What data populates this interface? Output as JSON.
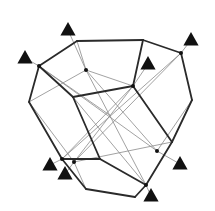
{
  "diagram": {
    "type": "polyhedron-wireframe",
    "background": "#ffffff",
    "stroke_color": "#2a2a2a",
    "thin_color": "#8a8a8a",
    "vertices": {
      "A": [
        39,
        66
      ],
      "B": [
        77,
        41
      ],
      "C": [
        143,
        40
      ],
      "D": [
        181,
        53
      ],
      "E": [
        192,
        100
      ],
      "F": [
        172,
        142
      ],
      "G": [
        146,
        185
      ],
      "H": [
        135,
        197
      ],
      "I": [
        86,
        189
      ],
      "J": [
        62,
        159
      ],
      "K": [
        29,
        102
      ],
      "L": [
        73,
        97
      ],
      "M": [
        133,
        86
      ],
      "N": [
        100,
        159
      ],
      "P": [
        86,
        70
      ],
      "Q": [
        157,
        151
      ],
      "R": [
        74,
        162
      ],
      "S": [
        111,
        116
      ]
    },
    "thick_edges": [
      [
        "A",
        "B"
      ],
      [
        "B",
        "C"
      ],
      [
        "C",
        "D"
      ],
      [
        "D",
        "E"
      ],
      [
        "E",
        "F"
      ],
      [
        "F",
        "G"
      ],
      [
        "G",
        "H"
      ],
      [
        "H",
        "I"
      ],
      [
        "I",
        "J"
      ],
      [
        "J",
        "K"
      ],
      [
        "K",
        "A"
      ],
      [
        "A",
        "L"
      ],
      [
        "L",
        "M"
      ],
      [
        "M",
        "C"
      ],
      [
        "M",
        "F"
      ],
      [
        "L",
        "N"
      ],
      [
        "N",
        "G"
      ],
      [
        "J",
        "N"
      ]
    ],
    "thin_edges": [
      [
        "P",
        "B"
      ],
      [
        "P",
        "M"
      ],
      [
        "P",
        "K"
      ],
      [
        "P",
        "Q"
      ],
      [
        "M",
        "R"
      ],
      [
        "M",
        "J"
      ],
      [
        "D",
        "R"
      ],
      [
        "D",
        "J"
      ],
      [
        "A",
        "Q"
      ],
      [
        "K",
        "R"
      ],
      [
        "Q",
        "E"
      ],
      [
        "R",
        "I"
      ],
      [
        "L",
        "G"
      ],
      [
        "P",
        "G"
      ],
      [
        "S",
        "A"
      ],
      [
        "F",
        "R"
      ]
    ],
    "dots": [
      "A",
      "D",
      "M",
      "P",
      "Q",
      "J",
      "R",
      "G"
    ],
    "triangles": [
      {
        "x": 68,
        "y": 30
      },
      {
        "x": 25,
        "y": 58
      },
      {
        "x": 191,
        "y": 40
      },
      {
        "x": 148,
        "y": 64
      },
      {
        "x": 50,
        "y": 165
      },
      {
        "x": 65,
        "y": 174
      },
      {
        "x": 180,
        "y": 164
      },
      {
        "x": 151,
        "y": 196
      }
    ],
    "triangle_leaders": [
      [
        [
          68,
          30
        ],
        [
          86,
          70
        ]
      ],
      [
        [
          25,
          58
        ],
        [
          39,
          66
        ]
      ],
      [
        [
          191,
          40
        ],
        [
          181,
          53
        ]
      ],
      [
        [
          148,
          64
        ],
        [
          133,
          86
        ]
      ],
      [
        [
          50,
          165
        ],
        [
          62,
          159
        ]
      ],
      [
        [
          65,
          174
        ],
        [
          74,
          162
        ]
      ],
      [
        [
          180,
          164
        ],
        [
          157,
          151
        ]
      ],
      [
        [
          151,
          196
        ],
        [
          146,
          185
        ]
      ]
    ]
  }
}
